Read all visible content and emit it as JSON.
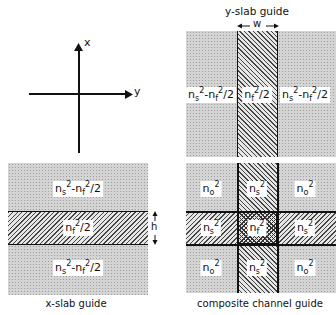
{
  "axes": {
    "x_label": "x",
    "y_label": "y"
  },
  "y_slab": {
    "title": "y-slab guide",
    "width_label": "w",
    "regions": [
      {
        "name": "left-cladding",
        "base": "n",
        "sub1": "s",
        "exp1": "2",
        "op": "-",
        "base2": "n",
        "sub2": "f",
        "exp2": "2",
        "tail": "/2"
      },
      {
        "name": "core",
        "base": "n",
        "sub1": "f",
        "exp1": "2",
        "tail": "/2"
      },
      {
        "name": "right-cladding",
        "base": "n",
        "sub1": "s",
        "exp1": "2",
        "op": "-",
        "base2": "n",
        "sub2": "f",
        "exp2": "2",
        "tail": "/2"
      }
    ]
  },
  "x_slab": {
    "caption": "x-slab guide",
    "height_label": "h",
    "regions": [
      {
        "name": "top-cladding",
        "base": "n",
        "sub1": "s",
        "exp1": "2",
        "op": "-",
        "base2": "n",
        "sub2": "f",
        "exp2": "2",
        "tail": "/2"
      },
      {
        "name": "core",
        "base": "n",
        "sub1": "f",
        "exp1": "2",
        "tail": "/2"
      },
      {
        "name": "bottom-cladding",
        "base": "n",
        "sub1": "s",
        "exp1": "2",
        "op": "-",
        "base2": "n",
        "sub2": "f",
        "exp2": "2",
        "tail": "/2"
      }
    ]
  },
  "composite": {
    "caption": "composite channel guide",
    "cells": [
      {
        "base": "n",
        "sub": "o",
        "exp": "2"
      },
      {
        "base": "n",
        "sub": "s",
        "exp": "2"
      },
      {
        "base": "n",
        "sub": "o",
        "exp": "2"
      },
      {
        "base": "n",
        "sub": "s",
        "exp": "2"
      },
      {
        "base": "n",
        "sub": "f",
        "exp": "2"
      },
      {
        "base": "n",
        "sub": "s",
        "exp": "2"
      },
      {
        "base": "n",
        "sub": "o",
        "exp": "2"
      },
      {
        "base": "n",
        "sub": "s",
        "exp": "2"
      },
      {
        "base": "n",
        "sub": "o",
        "exp": "2"
      }
    ]
  }
}
